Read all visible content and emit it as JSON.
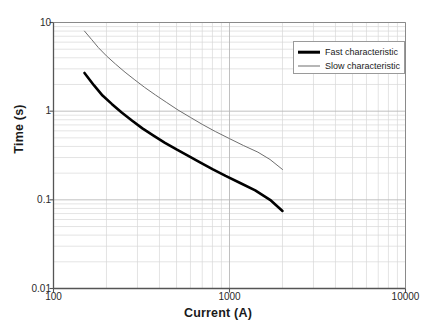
{
  "chart_data": {
    "type": "line",
    "title": "",
    "xlabel": "Current (A)",
    "ylabel": "Time (s)",
    "xscale": "log",
    "yscale": "log",
    "xlim": [
      100,
      10000
    ],
    "ylim": [
      0.01,
      10
    ],
    "xticks": [
      "100",
      "1000",
      "10000"
    ],
    "xtick_values": [
      100,
      1000,
      10000
    ],
    "yticks": [
      "10",
      "1",
      "0.1",
      "0.01"
    ],
    "ytick_values": [
      10,
      1,
      0.1,
      0.01
    ],
    "grid": true,
    "minor_grid": true,
    "legend_position": "top-right",
    "series": [
      {
        "name": "Fast characteristic",
        "color": "#000000",
        "linewidth": 2.6,
        "x": [
          150,
          170,
          190,
          215,
          245,
          280,
          320,
          370,
          430,
          500,
          580,
          680,
          800,
          950,
          1150,
          1400,
          1700,
          2000
        ],
        "y": [
          2.7,
          1.95,
          1.5,
          1.2,
          0.96,
          0.78,
          0.64,
          0.53,
          0.44,
          0.37,
          0.315,
          0.265,
          0.222,
          0.186,
          0.155,
          0.128,
          0.1,
          0.075
        ]
      },
      {
        "name": "Slow characteristic",
        "color": "#6e6e6e",
        "linewidth": 1.0,
        "x": [
          150,
          165,
          180,
          200,
          225,
          255,
          290,
          330,
          380,
          440,
          510,
          600,
          700,
          830,
          1000,
          1200,
          1450,
          1700,
          2000
        ],
        "y": [
          8.0,
          6.4,
          5.2,
          4.2,
          3.4,
          2.75,
          2.25,
          1.85,
          1.52,
          1.25,
          1.03,
          0.85,
          0.71,
          0.59,
          0.49,
          0.41,
          0.345,
          0.285,
          0.22
        ]
      }
    ]
  },
  "legend": {
    "items": [
      {
        "label": "Fast characteristic",
        "style": "thick-black"
      },
      {
        "label": "Slow characteristic",
        "style": "thin-gray"
      }
    ]
  },
  "colors": {
    "axis": "#555555",
    "major_grid": "#b9b9b9",
    "minor_grid": "#d8d8d8",
    "background": "#ffffff",
    "text": "#1a1a1a"
  }
}
